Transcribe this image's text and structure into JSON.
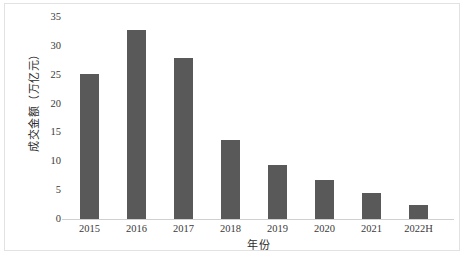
{
  "chart_data": {
    "type": "bar",
    "title": "",
    "subtitle": "",
    "xlabel": "年份",
    "ylabel": "成交金额（万亿元）",
    "categories": [
      "2015",
      "2016",
      "2017",
      "2018",
      "2019",
      "2020",
      "2021",
      "2022H"
    ],
    "values": [
      25.3,
      33.0,
      28.0,
      13.9,
      9.5,
      6.9,
      4.7,
      2.6
    ],
    "ylim": [
      0,
      35
    ],
    "yticks": [
      0,
      5,
      10,
      15,
      20,
      25,
      30,
      35
    ],
    "ytick_labels": [
      "0",
      "5",
      "10",
      "15",
      "20",
      "25",
      "30",
      "35"
    ],
    "grid": false,
    "legend": false,
    "legend_position": "none",
    "series": [
      {
        "name": "成交金额",
        "values": [
          25.3,
          33.0,
          28.0,
          13.9,
          9.5,
          6.9,
          4.7,
          2.6
        ]
      }
    ],
    "colors": {
      "bar": "#595959",
      "axis_line": "#d0d0d0",
      "text": "#3a3a3a",
      "frame_border": "#e2e2e2",
      "background": "#ffffff"
    }
  }
}
